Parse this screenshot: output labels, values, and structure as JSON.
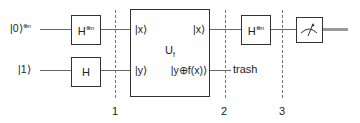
{
  "circuit": {
    "inputs": [
      {
        "label": "|0⟩",
        "superscript": "⊗n"
      },
      {
        "label": "|1⟩"
      }
    ],
    "gates": {
      "h_top_left": {
        "label": "H",
        "superscript": "⊗n"
      },
      "h_bottom": {
        "label": "H"
      },
      "oracle": {
        "label": "U",
        "subscript": "f",
        "in_top": "|x⟩",
        "in_bottom": "|y⟩",
        "out_top": "|x⟩",
        "out_bottom": "|y⊕f(x)⟩"
      },
      "h_top_right": {
        "label": "H",
        "superscript": "⊗n"
      },
      "measure": {
        "icon": "meter-icon"
      }
    },
    "trash_label": "trash",
    "stages": [
      "1",
      "2",
      "3"
    ]
  }
}
